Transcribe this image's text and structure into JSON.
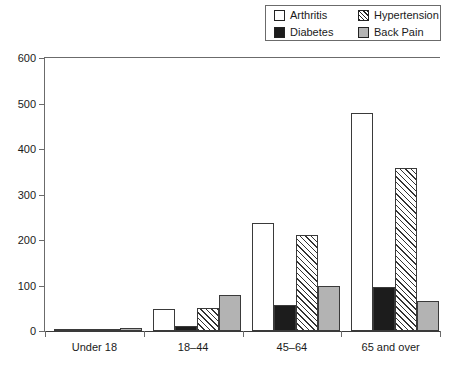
{
  "chart_data": {
    "type": "bar",
    "title": "",
    "xlabel": "",
    "ylabel": "",
    "ylim": [
      0,
      600
    ],
    "yticks": [
      0,
      100,
      200,
      300,
      400,
      500,
      600
    ],
    "grid": false,
    "legend_position": "top-right",
    "categories": [
      "Under 18",
      "18–44",
      "45–64",
      "65 and over"
    ],
    "series": [
      {
        "name": "Arthritis",
        "values": [
          2,
          48,
          237,
          480
        ],
        "fill": "open",
        "color": "#ffffff"
      },
      {
        "name": "Diabetes",
        "values": [
          1,
          11,
          57,
          97
        ],
        "fill": "solid",
        "color": "#1c1c1c"
      },
      {
        "name": "Hypertension",
        "values": [
          2,
          50,
          212,
          358
        ],
        "fill": "hatch",
        "color": "#ffffff"
      },
      {
        "name": "Back Pain",
        "values": [
          7,
          80,
          100,
          65
        ],
        "fill": "gray",
        "color": "#b3b3b3"
      }
    ]
  },
  "legend": {
    "items": [
      {
        "label": "Arthritis",
        "swatch": "open"
      },
      {
        "label": "Hypertension",
        "swatch": "hatch"
      },
      {
        "label": "Diabetes",
        "swatch": "solid"
      },
      {
        "label": "Back Pain",
        "swatch": "gray"
      }
    ]
  },
  "axis": {
    "y_tick_labels": [
      "600",
      "500",
      "400",
      "300",
      "200",
      "100",
      "0"
    ]
  }
}
